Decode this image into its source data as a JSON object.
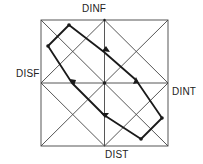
{
  "diagram": {
    "title": "",
    "axis_labels": {
      "top": "DINF",
      "left": "DISF",
      "right": "DINT",
      "bottom": "DIST"
    },
    "grid": "square divided by center cross, both main diagonals, and inner diamond lines",
    "path": {
      "description": "closed bold loop with arrowheads indicating circulation direction",
      "vertex_count": 4,
      "arrow_count": 4
    },
    "colors": {
      "line": "#333333",
      "path": "#1a1a1a",
      "background": "#ffffff"
    }
  }
}
